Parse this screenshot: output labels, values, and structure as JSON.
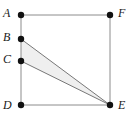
{
  "figure": {
    "kind": "plane-geometry-diagram",
    "width": 131,
    "height": 124,
    "background_color": "#ffffff",
    "stroke_color": "#8c8c8c",
    "stroke_width": 1,
    "vertex_dot_color": "#111111",
    "vertex_dot_radius": 3.2,
    "shaded_fill_color": "#efefef",
    "shaded_edge_color": "#777777",
    "label_color": "#1a1a1a"
  },
  "points": {
    "A": {
      "label": "A",
      "x": 21,
      "y": 15,
      "label_x": 3,
      "label_y": 7,
      "position": "top-left-outside"
    },
    "B": {
      "label": "B",
      "x": 21,
      "y": 39,
      "label_x": 3,
      "label_y": 31,
      "position": "left-outside"
    },
    "C": {
      "label": "C",
      "x": 21,
      "y": 61,
      "label_x": 3,
      "label_y": 53,
      "position": "left-outside"
    },
    "D": {
      "label": "D",
      "x": 21,
      "y": 105,
      "label_x": 3,
      "label_y": 99,
      "position": "bottom-left-outside"
    },
    "E": {
      "label": "E",
      "x": 110,
      "y": 105,
      "label_x": 118,
      "label_y": 99,
      "position": "bottom-right-outside"
    },
    "F": {
      "label": "F",
      "x": 110,
      "y": 15,
      "label_x": 118,
      "label_y": 7,
      "position": "top-right-outside"
    }
  },
  "segments": [
    {
      "name": "segment-AF",
      "from": "A",
      "to": "F",
      "role": "square-top-edge"
    },
    {
      "name": "segment-AD",
      "from": "A",
      "to": "D",
      "role": "square-left-edge"
    },
    {
      "name": "segment-FE",
      "from": "F",
      "to": "E",
      "role": "square-right-edge"
    },
    {
      "name": "segment-DE",
      "from": "D",
      "to": "E",
      "role": "square-bottom-edge"
    },
    {
      "name": "segment-BE",
      "from": "B",
      "to": "E",
      "role": "triangle-upper-side"
    },
    {
      "name": "segment-CE",
      "from": "C",
      "to": "E",
      "role": "triangle-lower-side"
    }
  ],
  "shaded_region": {
    "name": "triangle-BCE",
    "vertices": [
      "B",
      "C",
      "E"
    ],
    "fill": "#efefef"
  },
  "vertex_order": [
    "A",
    "B",
    "C",
    "D",
    "E",
    "F"
  ]
}
